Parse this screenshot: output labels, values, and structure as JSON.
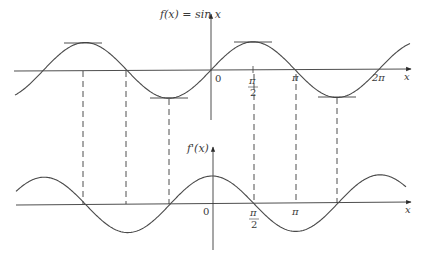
{
  "diagram": {
    "top_graph": {
      "function_label": "f(x) = sin x",
      "x_axis_label": "x",
      "origin_label": "0",
      "tick_labels": {
        "pi_over_2_num": "π",
        "pi_over_2_den": "2",
        "pi": "π",
        "two_pi": "2π"
      }
    },
    "bottom_graph": {
      "function_label": "f'(x)",
      "x_axis_label": "x",
      "origin_label": "0",
      "tick_labels": {
        "pi_over_2_num": "π",
        "pi_over_2_den": "2",
        "pi": "π"
      }
    },
    "annotations": {
      "horizontal_tangents_at": [
        "-3π/2",
        "-π/2",
        "π/2",
        "3π/2"
      ],
      "dashed_guides_at": [
        "-3π/2",
        "-π",
        "-π/2",
        "π/2",
        "π",
        "3π/2"
      ]
    },
    "colors": {
      "curve": "#4a4a4a",
      "axis": "#3a3a3a",
      "text": "#3a3a3a"
    }
  }
}
